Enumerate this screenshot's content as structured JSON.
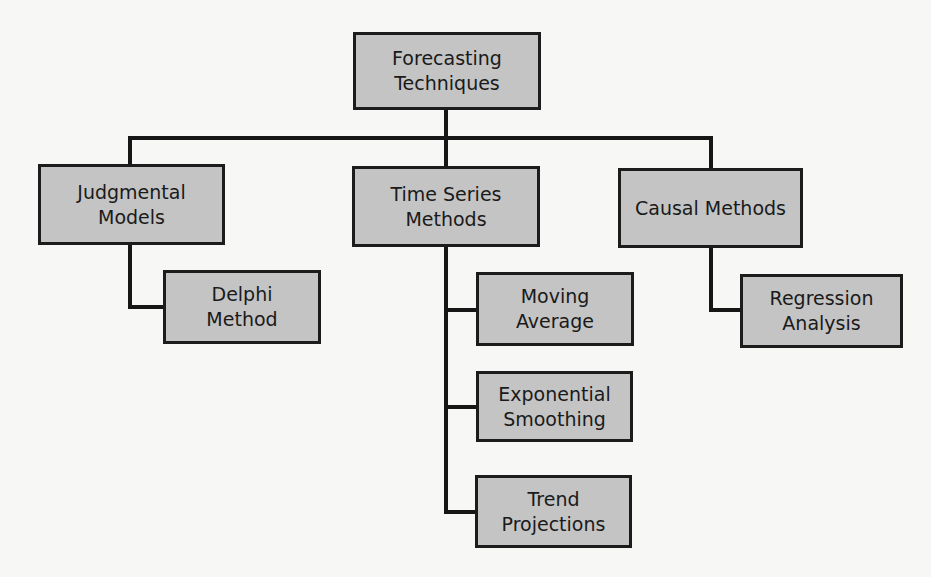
{
  "diagram": {
    "type": "hierarchy",
    "root": {
      "id": "root",
      "label": "Forecasting\nTechniques"
    },
    "categories": [
      {
        "id": "judgmental",
        "label": "Judgmental\nModels",
        "children": [
          {
            "id": "delphi",
            "label": "Delphi\nMethod"
          }
        ]
      },
      {
        "id": "timeseries",
        "label": "Time Series\nMethods",
        "children": [
          {
            "id": "moving",
            "label": "Moving\nAverage"
          },
          {
            "id": "exponential",
            "label": "Exponential\nSmoothing"
          },
          {
            "id": "trend",
            "label": "Trend\nProjections"
          }
        ]
      },
      {
        "id": "causal",
        "label": "Causal Methods",
        "children": [
          {
            "id": "regression",
            "label": "Regression\nAnalysis"
          }
        ]
      }
    ],
    "colors": {
      "box_fill": "#c4c4c4",
      "border": "#1c1c1c",
      "background": "#f7f7f5"
    }
  }
}
